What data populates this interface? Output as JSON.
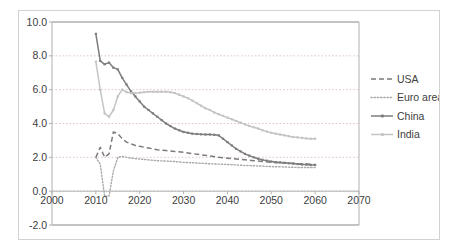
{
  "chart_data": {
    "type": "line",
    "title": "",
    "subtitle": "",
    "xlabel": "",
    "ylabel": "",
    "xlim": [
      2000,
      2070
    ],
    "ylim": [
      -2.0,
      10.0
    ],
    "grid": true,
    "legend_position": "right",
    "x_ticks": [
      "2000",
      "2010",
      "2020",
      "2030",
      "2040",
      "2050",
      "2060",
      "2070"
    ],
    "y_ticks": [
      "10.0",
      "8.0",
      "6.0",
      "4.0",
      "2.0",
      "0.0",
      "-2.0"
    ],
    "x_tick_values": [
      2000,
      2010,
      2020,
      2030,
      2040,
      2050,
      2060,
      2070
    ],
    "y_tick_values": [
      10.0,
      8.0,
      6.0,
      4.0,
      2.0,
      0.0,
      -2.0
    ],
    "series": [
      {
        "name": "USA",
        "color": "#7a7a7a",
        "style": "dashed",
        "markers": false,
        "x": [
          2010,
          2011,
          2012,
          2013,
          2014,
          2015,
          2016,
          2017,
          2018,
          2019,
          2020,
          2022,
          2024,
          2026,
          2028,
          2030,
          2032,
          2034,
          2036,
          2038,
          2040,
          2042,
          2044,
          2046,
          2048,
          2050,
          2052,
          2054,
          2056,
          2058,
          2060
        ],
        "y": [
          2.0,
          2.6,
          2.0,
          2.2,
          3.5,
          3.4,
          3.1,
          2.9,
          2.8,
          2.7,
          2.65,
          2.55,
          2.45,
          2.4,
          2.35,
          2.3,
          2.22,
          2.15,
          2.08,
          2.0,
          1.95,
          1.9,
          1.85,
          1.8,
          1.75,
          1.7,
          1.68,
          1.65,
          1.62,
          1.6,
          1.58
        ]
      },
      {
        "name": "Euro area",
        "color": "#a8a8a8",
        "style": "dotted",
        "markers": false,
        "x": [
          2010,
          2011,
          2012,
          2013,
          2014,
          2015,
          2016,
          2017,
          2018,
          2020,
          2022,
          2024,
          2026,
          2028,
          2030,
          2032,
          2034,
          2036,
          2038,
          2040,
          2042,
          2044,
          2046,
          2048,
          2050,
          2052,
          2054,
          2056,
          2058,
          2060
        ],
        "y": [
          2.0,
          1.6,
          -0.3,
          -0.3,
          1.2,
          2.0,
          2.05,
          2.0,
          1.95,
          1.9,
          1.85,
          1.8,
          1.78,
          1.75,
          1.7,
          1.68,
          1.65,
          1.62,
          1.6,
          1.58,
          1.55,
          1.52,
          1.5,
          1.48,
          1.45,
          1.44,
          1.42,
          1.4,
          1.4,
          1.4
        ]
      },
      {
        "name": "China",
        "color": "#7d7d7d",
        "style": "solid",
        "markers": true,
        "x": [
          2010,
          2011,
          2012,
          2013,
          2014,
          2015,
          2016,
          2017,
          2018,
          2019,
          2020,
          2021,
          2022,
          2023,
          2024,
          2025,
          2026,
          2027,
          2028,
          2029,
          2030,
          2031,
          2032,
          2033,
          2034,
          2035,
          2036,
          2037,
          2038,
          2039,
          2040,
          2041,
          2042,
          2043,
          2044,
          2045,
          2046,
          2047,
          2048,
          2049,
          2050,
          2051,
          2052,
          2053,
          2054,
          2055,
          2056,
          2057,
          2058,
          2059,
          2060
        ],
        "y": [
          9.3,
          7.7,
          7.5,
          7.6,
          7.3,
          7.2,
          6.7,
          6.3,
          5.9,
          5.6,
          5.3,
          5.0,
          4.8,
          4.6,
          4.4,
          4.2,
          4.0,
          3.85,
          3.7,
          3.6,
          3.5,
          3.45,
          3.4,
          3.38,
          3.36,
          3.35,
          3.35,
          3.33,
          3.3,
          3.1,
          2.9,
          2.7,
          2.5,
          2.35,
          2.2,
          2.1,
          2.0,
          1.92,
          1.85,
          1.8,
          1.75,
          1.72,
          1.7,
          1.68,
          1.65,
          1.63,
          1.6,
          1.58,
          1.57,
          1.55,
          1.55
        ]
      },
      {
        "name": "India",
        "color": "#c4c4c4",
        "style": "solid",
        "markers": true,
        "x": [
          2010,
          2011,
          2012,
          2013,
          2014,
          2015,
          2016,
          2017,
          2018,
          2019,
          2020,
          2021,
          2022,
          2023,
          2024,
          2025,
          2026,
          2027,
          2028,
          2029,
          2030,
          2031,
          2032,
          2033,
          2034,
          2035,
          2036,
          2037,
          2038,
          2039,
          2040,
          2041,
          2042,
          2043,
          2044,
          2045,
          2046,
          2047,
          2048,
          2049,
          2050,
          2051,
          2052,
          2053,
          2054,
          2055,
          2056,
          2057,
          2058,
          2059,
          2060
        ],
        "y": [
          7.65,
          6.0,
          4.6,
          4.4,
          4.8,
          5.6,
          6.0,
          5.85,
          5.8,
          5.8,
          5.82,
          5.85,
          5.87,
          5.88,
          5.88,
          5.88,
          5.88,
          5.85,
          5.8,
          5.7,
          5.6,
          5.5,
          5.35,
          5.2,
          5.05,
          4.9,
          4.8,
          4.65,
          4.55,
          4.45,
          4.35,
          4.25,
          4.15,
          4.05,
          3.95,
          3.85,
          3.78,
          3.7,
          3.6,
          3.52,
          3.45,
          3.4,
          3.35,
          3.3,
          3.25,
          3.2,
          3.18,
          3.15,
          3.12,
          3.1,
          3.1
        ]
      }
    ]
  },
  "legend": {
    "items": [
      {
        "label": "USA"
      },
      {
        "label": "Euro area"
      },
      {
        "label": "China"
      },
      {
        "label": "India"
      }
    ]
  }
}
